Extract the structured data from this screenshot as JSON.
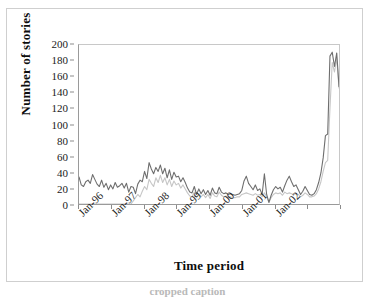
{
  "chart_data": {
    "type": "line",
    "title": "",
    "xlabel": "Time period",
    "ylabel": "Number of stories",
    "ylim": [
      0,
      200
    ],
    "ytick_step": 20,
    "yticks": [
      0,
      20,
      40,
      60,
      80,
      100,
      120,
      140,
      160,
      180,
      200
    ],
    "grid": false,
    "legend": "none",
    "x_tick_labels": [
      "Jan-96",
      "Jan-97",
      "Jan-98",
      "Jan-99",
      "Jan-00",
      "Jan-01",
      "Jan-02"
    ],
    "x_tick_count": 9,
    "x_axis_note": "monthly points, Jan-1996 through late 2002",
    "series": [
      {
        "name": "series-dark",
        "color": "#6e6e6e",
        "values": [
          34,
          24,
          22,
          28,
          30,
          26,
          37,
          31,
          25,
          22,
          30,
          21,
          26,
          18,
          24,
          19,
          27,
          21,
          23,
          26,
          20,
          26,
          15,
          22,
          21,
          13,
          25,
          30,
          28,
          41,
          32,
          52,
          44,
          38,
          46,
          41,
          49,
          38,
          45,
          33,
          43,
          31,
          40,
          34,
          35,
          28,
          33,
          27,
          20,
          15,
          14,
          22,
          12,
          19,
          13,
          18,
          12,
          17,
          11,
          20,
          14,
          13,
          21,
          15,
          13,
          14,
          12,
          13,
          12,
          11,
          12,
          13,
          17,
          29,
          35,
          26,
          22,
          18,
          24,
          17,
          19,
          12,
          38,
          12,
          2,
          11,
          18,
          22,
          19,
          21,
          15,
          23,
          30,
          35,
          28,
          22,
          24,
          18,
          12,
          16,
          22,
          17,
          12,
          11,
          13,
          18,
          27,
          39,
          58,
          86,
          88,
          186,
          191,
          173,
          190,
          148
        ]
      },
      {
        "name": "series-light",
        "color": "#c6c6c6",
        "values": [
          0,
          0,
          0,
          0,
          0,
          0,
          0,
          0,
          0,
          0,
          0,
          0,
          0,
          0,
          0,
          0,
          0,
          0,
          0,
          0,
          0,
          0,
          0,
          0,
          4,
          8,
          12,
          9,
          16,
          22,
          18,
          31,
          26,
          22,
          33,
          27,
          36,
          27,
          33,
          24,
          31,
          22,
          29,
          24,
          26,
          20,
          24,
          19,
          14,
          10,
          9,
          15,
          8,
          13,
          9,
          12,
          8,
          12,
          7,
          14,
          10,
          9,
          15,
          11,
          9,
          10,
          8,
          9,
          8,
          8,
          9,
          9,
          12,
          13,
          14,
          13,
          12,
          11,
          13,
          11,
          12,
          9,
          14,
          9,
          2,
          8,
          12,
          14,
          13,
          14,
          11,
          15,
          13,
          14,
          13,
          12,
          13,
          12,
          9,
          11,
          14,
          12,
          9,
          9,
          10,
          13,
          19,
          28,
          41,
          52,
          55,
          120,
          178,
          166,
          183,
          146
        ]
      }
    ]
  },
  "axis": {
    "y_title": "Number of stories",
    "x_title": "Time period"
  },
  "caption": {
    "partial_text": "cropped caption"
  }
}
